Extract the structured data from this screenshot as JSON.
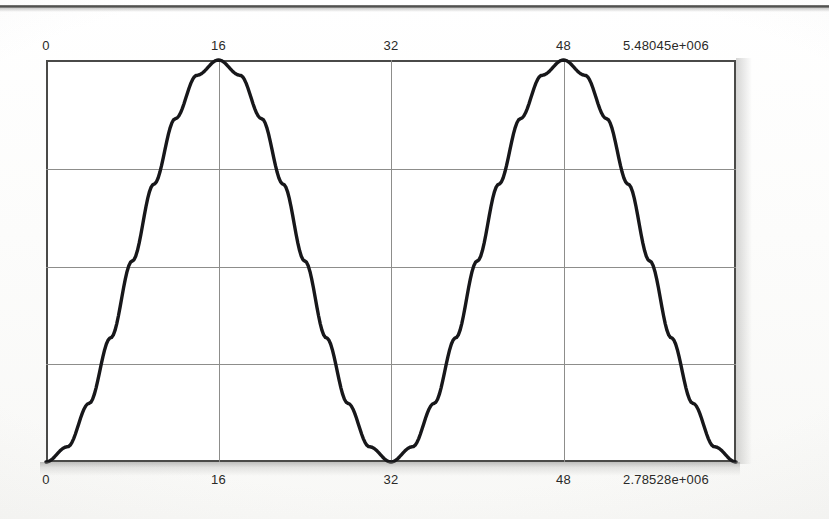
{
  "page": {
    "width": 829,
    "height": 519,
    "background": "#fdfdfc",
    "top_rule": true
  },
  "chart_data": {
    "type": "line",
    "title": "",
    "subtitle": "",
    "xlabel": "",
    "ylabel": "",
    "grid": true,
    "legend": null,
    "top_axis": {
      "ticks": [
        0,
        16,
        32,
        48
      ],
      "tick_labels": [
        "0",
        "16",
        "32",
        "48"
      ],
      "corner_label": "5.48045e+006",
      "range": [
        0,
        64
      ]
    },
    "bottom_axis": {
      "ticks": [
        0,
        16,
        32,
        48
      ],
      "tick_labels": [
        "0",
        "16",
        "32",
        "48"
      ],
      "corner_label": "2.78528e+006",
      "range": [
        0,
        64
      ]
    },
    "xlim": [
      0,
      64
    ],
    "ylim": [
      0,
      1
    ],
    "gridlines_x": [
      16,
      32,
      48
    ],
    "gridlines_y": [
      0.244,
      0.485,
      0.729
    ],
    "series": [
      {
        "name": "curve",
        "color": "#17171a",
        "linewidth": 3.4,
        "description": "two-hump sinusoid, zeros at x=0,32,64 and maxima at x=16,48",
        "x": [
          0,
          2,
          4,
          6,
          8,
          10,
          12,
          14,
          16,
          18,
          20,
          22,
          24,
          26,
          28,
          30,
          32,
          34,
          36,
          38,
          40,
          42,
          44,
          46,
          48,
          50,
          52,
          54,
          56,
          58,
          60,
          62,
          64
        ],
        "y": [
          0.0,
          0.038,
          0.146,
          0.309,
          0.5,
          0.691,
          0.854,
          0.962,
          1.0,
          0.962,
          0.854,
          0.691,
          0.5,
          0.309,
          0.146,
          0.038,
          0.0,
          0.038,
          0.146,
          0.309,
          0.5,
          0.691,
          0.854,
          0.962,
          1.0,
          0.962,
          0.854,
          0.691,
          0.5,
          0.309,
          0.146,
          0.038,
          0.0
        ]
      }
    ],
    "peaks": [
      {
        "x": 16,
        "y": 1.0
      },
      {
        "x": 48,
        "y": 1.0
      }
    ],
    "zeros": [
      {
        "x": 0,
        "y": 0.0
      },
      {
        "x": 32,
        "y": 0.0
      },
      {
        "x": 64,
        "y": 0.0
      }
    ]
  },
  "colors": {
    "frame": "#4a4a48",
    "grid": "#8d8d8b",
    "curve": "#17171a",
    "text": "#2a2a28",
    "paper": "#fdfdfc"
  }
}
